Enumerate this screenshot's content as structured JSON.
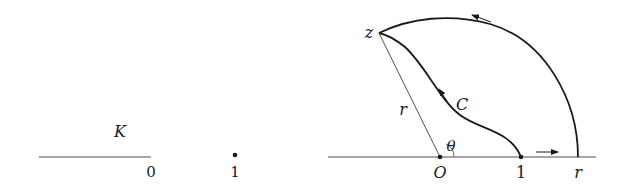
{
  "left_figure": {
    "region_label": "K",
    "origin_label": "0",
    "point_label": "1"
  },
  "right_figure": {
    "point_z_label": "z",
    "curve_label": "C",
    "radius_label": "r",
    "angle_label": "θ",
    "origin_label": "O",
    "one_label": "1",
    "r_axis_label": "r"
  },
  "colors": {
    "ink": "#1a1a1a",
    "thin_line": "#555555",
    "axis": "#888888"
  }
}
